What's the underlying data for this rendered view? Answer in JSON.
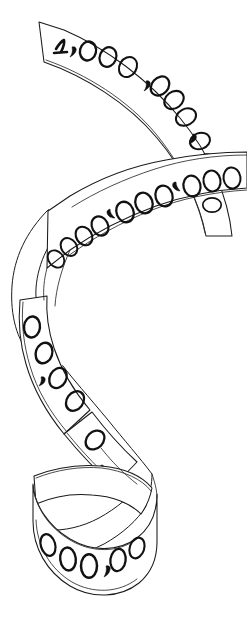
{
  "artwork": {
    "title": "1,000,000,000,000,000,000,000,000,000",
    "medium": "pen-and-ink line drawing",
    "subject": "spiral ribbon banner inscribed with a large number",
    "background_color": "#ffffff",
    "ink_color": "#111111",
    "line_color": "#1a1a1a",
    "canvas": {
      "width": 247,
      "height": 619
    }
  },
  "inscription": {
    "leading_digit": "1",
    "full_text": "1,000,000,000,000,000,000,000,000,000",
    "group_separator": ",",
    "groups": [
      {
        "id": "g0",
        "text": "1",
        "segment": "top-left-flat"
      },
      {
        "id": "g1",
        "text": "000",
        "segment": "top-arc"
      },
      {
        "id": "g2",
        "text": "000",
        "segment": "right-arc-upper"
      },
      {
        "id": "g3",
        "text": "000",
        "segment": "right-arc-lower"
      },
      {
        "id": "g4",
        "text": "000",
        "segment": "second-band-right"
      },
      {
        "id": "g5",
        "text": "000",
        "segment": "second-band-center"
      },
      {
        "id": "g6",
        "text": "000",
        "segment": "second-band-left"
      },
      {
        "id": "g7",
        "text": "000",
        "segment": "left-descent"
      },
      {
        "id": "g8",
        "text": "000",
        "segment": "mid-diagonal"
      },
      {
        "id": "g9",
        "text": "000",
        "segment": "bottom-curl"
      }
    ],
    "zero_count": 27,
    "comma_count": 9
  },
  "segments": [
    {
      "name": "top-flat-start",
      "description": "squared ribbon end at upper left bearing the numeral one"
    },
    {
      "name": "top-arc",
      "description": "ribbon arcs rightward across the top"
    },
    {
      "name": "right-arc",
      "description": "ribbon bends down the right edge"
    },
    {
      "name": "second-band",
      "description": "horizontal band running back leftward, digits mirrored"
    },
    {
      "name": "left-loop",
      "description": "ribbon loops around the left side showing blank reverse"
    },
    {
      "name": "mid-twist",
      "description": "x-shaped crossing where the ribbon flips over"
    },
    {
      "name": "bottom-curl",
      "description": "ribbon curls forward at the base showing final zeros"
    }
  ],
  "labels": {
    "figure_caption": "1,000,000,000,000,000,000,000,000,000"
  }
}
